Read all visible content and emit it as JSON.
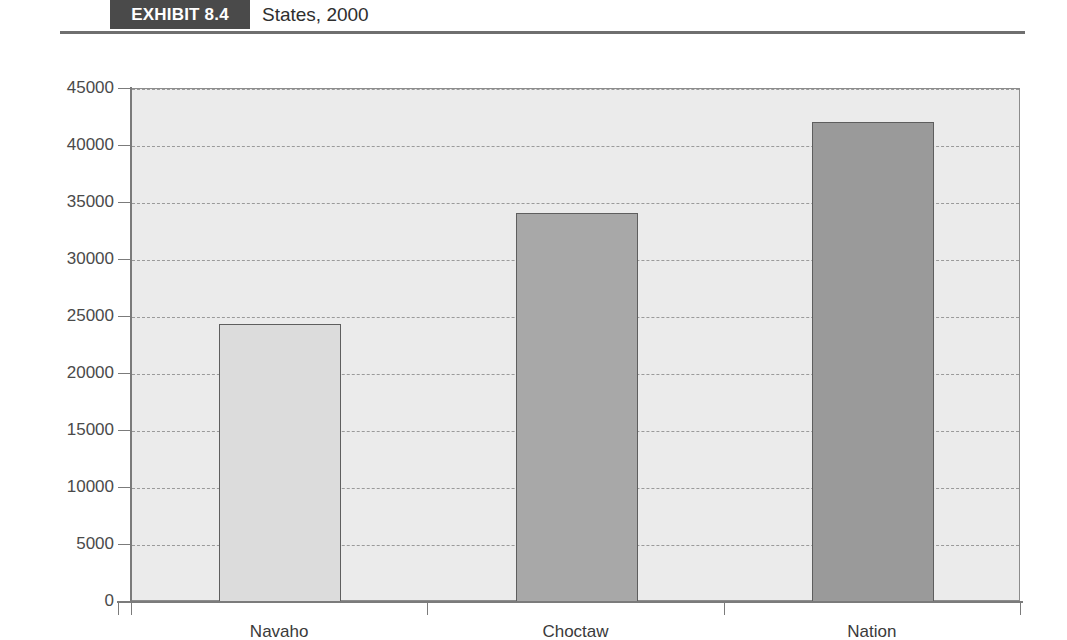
{
  "header": {
    "badge_label": "EXHIBIT 8.4",
    "title": "States, 2000",
    "badge_color": "#4a4a4a",
    "rule_color": "#6f6f6f"
  },
  "chart_data": {
    "type": "bar",
    "title": "States, 2000",
    "xlabel": "",
    "ylabel": "",
    "categories": [
      "Navaho",
      "Choctaw",
      "Nation"
    ],
    "values": [
      24400,
      34100,
      42100
    ],
    "series": [
      {
        "name": "Median household income",
        "values": [
          24400,
          34100,
          42100
        ]
      }
    ],
    "bar_colors": [
      "#dcdcdc",
      "#a8a8a8",
      "#9a9a9a"
    ],
    "bar_border_color": "#5e5e5e",
    "ylim": [
      0,
      45000
    ],
    "ytick_step": 5000,
    "yticks": [
      0,
      5000,
      10000,
      15000,
      20000,
      25000,
      30000,
      35000,
      40000,
      45000
    ],
    "ytick_labels": [
      "0",
      "5000",
      "10000",
      "15000",
      "20000",
      "25000",
      "30000",
      "35000",
      "40000",
      "45000"
    ],
    "grid": true,
    "grid_style": "dashed",
    "grid_color": "#9a9a9a",
    "legend": false,
    "legend_position": "none",
    "plot_background": "#ebebeb",
    "axis_color": "#7b7b7b"
  }
}
